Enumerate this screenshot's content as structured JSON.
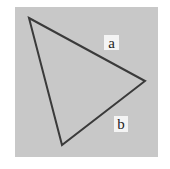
{
  "diagram": {
    "type": "triangle",
    "background_color": "#c8c8c8",
    "stroke_color": "#3a3a3a",
    "vertices": [
      [
        29,
        18
      ],
      [
        145,
        81
      ],
      [
        62,
        145
      ]
    ],
    "labels": {
      "a": "a",
      "b": "b"
    }
  }
}
